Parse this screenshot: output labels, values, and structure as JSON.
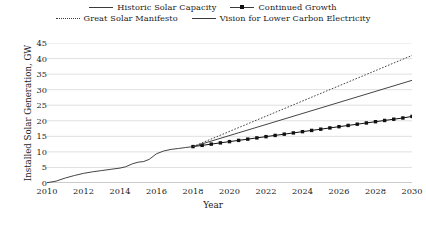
{
  "chart_data": {
    "type": "line",
    "title": "",
    "xlabel": "Year",
    "ylabel": "Installed Solar Generation, GW",
    "xlim": [
      2010,
      2030
    ],
    "ylim": [
      0,
      45
    ],
    "xticks": [
      2010,
      2012,
      2014,
      2016,
      2018,
      2020,
      2022,
      2024,
      2026,
      2028,
      2030
    ],
    "yticks": [
      0,
      5,
      10,
      15,
      20,
      25,
      30,
      35,
      40,
      45
    ],
    "grid": "horizontal",
    "legend_position": "top-center",
    "series": [
      {
        "name": "Historic Solar Capacity",
        "style": "solid",
        "marker": "none",
        "color": "#3a3a3a",
        "x": [
          2010,
          2010.5,
          2011,
          2011.5,
          2012,
          2012.5,
          2013,
          2013.5,
          2014,
          2014.3,
          2014.7,
          2015,
          2015.3,
          2015.6,
          2016,
          2016.4,
          2016.8,
          2017.2,
          2017.6,
          2018
        ],
        "values": [
          0.1,
          0.6,
          1.6,
          2.4,
          3.1,
          3.6,
          4.0,
          4.4,
          4.8,
          5.2,
          6.2,
          6.7,
          6.9,
          7.6,
          9.4,
          10.3,
          10.8,
          11.1,
          11.4,
          11.7
        ]
      },
      {
        "name": "Continued Growth",
        "style": "solid",
        "marker": "square",
        "color": "#111111",
        "x": [
          2018,
          2018.5,
          2019,
          2019.5,
          2020,
          2020.5,
          2021,
          2021.5,
          2022,
          2022.5,
          2023,
          2023.5,
          2024,
          2024.5,
          2025,
          2025.5,
          2026,
          2026.5,
          2027,
          2027.5,
          2028,
          2028.5,
          2029,
          2029.5,
          2030
        ],
        "values": [
          11.7,
          12.1,
          12.5,
          12.9,
          13.3,
          13.7,
          14.1,
          14.5,
          14.9,
          15.3,
          15.7,
          16.1,
          16.5,
          16.9,
          17.3,
          17.7,
          18.1,
          18.5,
          18.9,
          19.3,
          19.7,
          20.1,
          20.5,
          20.9,
          21.4
        ]
      },
      {
        "name": "Great Solar Manifesto",
        "style": "dotted",
        "marker": "none",
        "color": "#3a3a3a",
        "x": [
          2018,
          2030
        ],
        "values": [
          11.7,
          41.0
        ]
      },
      {
        "name": "Vision for Lower Carbon Electricity",
        "style": "solid",
        "marker": "none",
        "color": "#3a3a3a",
        "x": [
          2018,
          2030
        ],
        "values": [
          11.7,
          33.0
        ]
      }
    ]
  },
  "legend": {
    "rows": [
      [
        {
          "label": "Historic Solar Capacity",
          "mark": "line-solid"
        },
        {
          "label": "Continued Growth",
          "mark": "line-solid-square"
        }
      ],
      [
        {
          "label": "Great Solar Manifesto",
          "mark": "line-dotted"
        },
        {
          "label": "Vision for Lower Carbon Electricity",
          "mark": "line-solid"
        }
      ]
    ]
  }
}
